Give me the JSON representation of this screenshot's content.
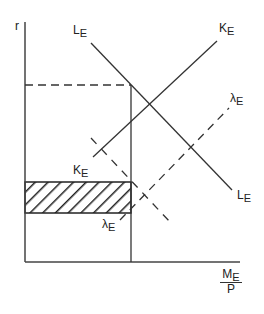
{
  "diagram": {
    "axes": {
      "y_label": "r",
      "x_label_numerator": "M",
      "x_label_numerator_sub": "E",
      "x_label_denominator": "P"
    },
    "curves": [
      {
        "id": "L_E",
        "label": "L",
        "sub": "E",
        "style": "solid",
        "slope": "downward"
      },
      {
        "id": "K_E",
        "label": "K",
        "sub": "E",
        "style": "solid",
        "slope": "upward"
      },
      {
        "id": "lambda_E",
        "label": "λ",
        "sub": "E",
        "style": "dashed",
        "slope": "upward"
      },
      {
        "id": "L_E_shifted",
        "label": "",
        "sub": "",
        "style": "dashed",
        "slope": "downward"
      }
    ],
    "labels": {
      "le_top": {
        "main": "L",
        "sub": "E"
      },
      "ke_top": {
        "main": "K",
        "sub": "E"
      },
      "lambda_right": {
        "main": "λ",
        "sub": "E"
      },
      "le_bottom": {
        "main": "L",
        "sub": "E"
      },
      "ke_bottom": {
        "main": "K",
        "sub": "E"
      },
      "lambda_bottom": {
        "main": "λ",
        "sub": "E"
      }
    },
    "shaded_region": {
      "pattern": "diagonal-hatch",
      "description": "rectangle between two interest rate levels"
    },
    "colors": {
      "ink": "#222222",
      "background": "#ffffff"
    }
  }
}
